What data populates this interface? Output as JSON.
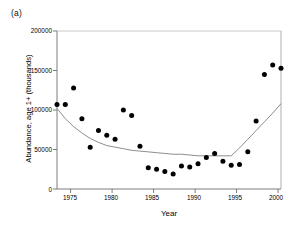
{
  "figure": {
    "panel_label": "(a)",
    "background_color": "#ffffff",
    "ink_color": "#000000",
    "curve_color": "#808080"
  },
  "chart_data": {
    "type": "scatter",
    "title": "",
    "subtitle": "",
    "xlabel": "Year",
    "ylabel": "Abundance, age 1+ (thousands)",
    "xlim": [
      1973,
      2000
    ],
    "ylim": [
      0,
      200000
    ],
    "xticks": [
      1975,
      1980,
      1985,
      1990,
      1995,
      2000
    ],
    "xticklabels": [
      "1975",
      "1980",
      "1985",
      "1990",
      "1995",
      "2000"
    ],
    "yticks": [
      0,
      50000,
      100000,
      150000,
      200000
    ],
    "yticklabels": [
      "0",
      "50000",
      "100000",
      "150000",
      "200000"
    ],
    "grid": false,
    "legend": false,
    "legend_position": "none",
    "series": [
      {
        "name": "Observed abundance",
        "marker": "filled-circle",
        "marker_color": "#000000",
        "x": [
          1973,
          1974,
          1975,
          1976,
          1977,
          1978,
          1979,
          1980,
          1981,
          1982,
          1983,
          1984,
          1985,
          1986,
          1987,
          1988,
          1989,
          1990,
          1991,
          1992,
          1993,
          1994,
          1995,
          1996,
          1997,
          1998,
          1999,
          2000
        ],
        "values": [
          107000,
          107000,
          128000,
          89000,
          53000,
          74000,
          68000,
          63000,
          100000,
          93000,
          54000,
          27000,
          25000,
          22000,
          19000,
          29000,
          28000,
          32000,
          40000,
          45000,
          35000,
          30000,
          31000,
          47000,
          86000,
          145000,
          157000,
          153000
        ]
      },
      {
        "name": "Fitted trend",
        "marker": "none",
        "line_color": "#808080",
        "x": [
          1973,
          1974,
          1975,
          1976,
          1977,
          1978,
          1979,
          1980,
          1981,
          1982,
          1983,
          1984,
          1985,
          1986,
          1987,
          1988,
          1989,
          1990,
          1991,
          1992,
          1993,
          1994,
          1995,
          1996,
          1997,
          1998,
          1999,
          2000
        ],
        "values": [
          102000,
          89000,
          79000,
          71000,
          64000,
          59000,
          55000,
          53000,
          51000,
          49000,
          48000,
          47000,
          46000,
          45000,
          44000,
          44000,
          43000,
          42000,
          42000,
          42000,
          42000,
          42000,
          52000,
          63000,
          74000,
          85000,
          96000,
          108000
        ]
      }
    ],
    "annotations": []
  }
}
